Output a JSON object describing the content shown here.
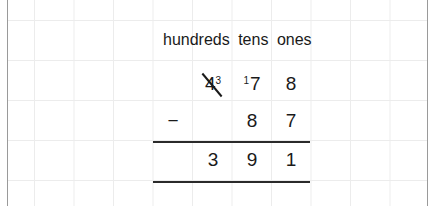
{
  "worksheet": {
    "headers": [
      "hundreds",
      "tens",
      "ones"
    ],
    "minuend": {
      "hundreds": {
        "digit": "4",
        "crossed_out": true,
        "regrouped_to": "3"
      },
      "tens": {
        "digit": "7",
        "borrowed_prefix": "1"
      },
      "ones": {
        "digit": "8"
      }
    },
    "operator": "−",
    "subtrahend": {
      "hundreds": "",
      "tens": "8",
      "ones": "7"
    },
    "difference": {
      "hundreds": "3",
      "tens": "9",
      "ones": "1"
    },
    "colors": {
      "text": "#1a1a1a",
      "grid": "#ececec",
      "border": "#9a9a9a"
    }
  }
}
